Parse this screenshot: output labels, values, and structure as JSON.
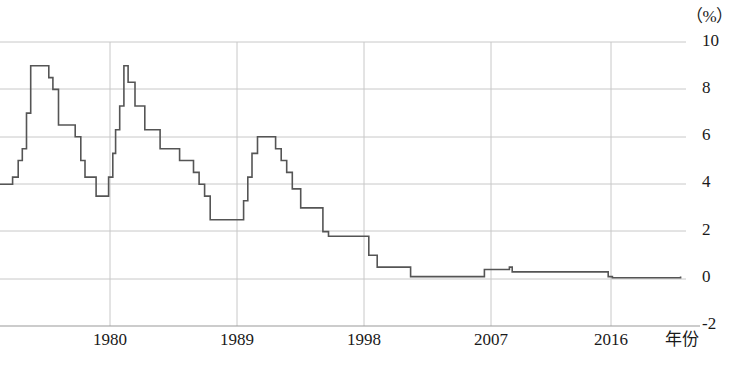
{
  "chart": {
    "unit_label": "（%）",
    "xaxis_title": "年份",
    "ylabel_ticks": [
      "10",
      "8",
      "6",
      "4",
      "2",
      "0",
      "-2"
    ],
    "xlabel_ticks": [
      "1980",
      "1989",
      "1998",
      "2007",
      "2016"
    ],
    "line_color": "#555555",
    "grid_color": "#c8c8c8",
    "axis_color": "#9a9a9a"
  },
  "chart_data": {
    "type": "line",
    "title": "",
    "subtitle": "",
    "xlabel": "年份",
    "ylabel": "（%）",
    "xlim": [
      1972,
      2021
    ],
    "ylim": [
      -2,
      10
    ],
    "yticks": [
      10,
      8,
      6,
      4,
      2,
      0,
      -2
    ],
    "xticks": [
      1980,
      1989,
      1998,
      2007,
      2016
    ],
    "grid": true,
    "legend": null,
    "step": "post",
    "series": [
      {
        "name": "利率",
        "x": [
          1972,
          1973.0,
          1973.4,
          1973.7,
          1974.0,
          1974.3,
          1975.3,
          1975.6,
          1975.9,
          1976.3,
          1977.1,
          1977.5,
          1977.9,
          1978.2,
          1979.0,
          1979.5,
          1979.9,
          1980.2,
          1980.4,
          1980.7,
          1981.0,
          1981.3,
          1981.8,
          1982.5,
          1983.6,
          1985.0,
          1986.0,
          1986.4,
          1986.8,
          1987.2,
          1989.2,
          1989.6,
          1989.9,
          1990.2,
          1990.6,
          1991.5,
          1991.9,
          1992.3,
          1992.7,
          1993.1,
          1993.7,
          1995.3,
          1995.7,
          1998.6,
          1999.2,
          2001.0,
          2001.6,
          2006.3,
          2006.9,
          2008.7,
          2008.9,
          2015.8,
          2016.1,
          2021
        ],
        "y": [
          4.0,
          4.3,
          5.0,
          5.5,
          7.0,
          9.0,
          9.0,
          8.5,
          8.0,
          6.5,
          6.5,
          6.0,
          5.0,
          4.3,
          3.5,
          3.5,
          4.3,
          5.3,
          6.3,
          7.3,
          9.0,
          8.3,
          7.3,
          6.3,
          5.5,
          5.0,
          4.5,
          4.0,
          3.5,
          2.5,
          2.5,
          3.3,
          4.3,
          5.3,
          6.0,
          6.0,
          5.5,
          5.0,
          4.5,
          3.8,
          3.0,
          2.0,
          1.8,
          1.0,
          0.5,
          0.5,
          0.1,
          0.1,
          0.4,
          0.5,
          0.3,
          0.1,
          0.05,
          0.1
        ],
        "color": "#555555"
      }
    ]
  }
}
